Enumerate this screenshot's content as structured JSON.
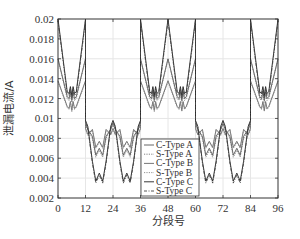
{
  "chart_data": {
    "type": "line",
    "title": "",
    "xlabel": "分段号",
    "ylabel": "泄漏电流/A",
    "xlim": [
      0,
      96
    ],
    "ylim": [
      0.002,
      0.02
    ],
    "xticks": [
      0,
      12,
      24,
      36,
      48,
      60,
      72,
      84,
      96
    ],
    "yticks": [
      0.002,
      0.004,
      0.006,
      0.008,
      0.01,
      0.012,
      0.014,
      0.016,
      0.018,
      0.02
    ],
    "ytick_labels": [
      "0.002",
      "0.004",
      "0.006",
      "0.008",
      "0.01",
      "0.012",
      "0.014",
      "0.016",
      "0.018",
      "0.02"
    ],
    "grid": true,
    "legend_position": "lower center",
    "series": [
      {
        "name": "C-Type A",
        "style": "solid",
        "color": "#555555",
        "high_peak": 0.016,
        "high_trough": 0.012,
        "low_edge": 0.0095,
        "low_dip": 0.0063,
        "low_bump": 0.007
      },
      {
        "name": "S-Type A",
        "style": "dotted",
        "color": "#777777",
        "high_peak": 0.016,
        "high_trough": 0.0118,
        "low_edge": 0.0094,
        "low_dip": 0.0061,
        "low_bump": 0.0068
      },
      {
        "name": "C-Type B",
        "style": "solid",
        "color": "#666666",
        "high_peak": 0.0138,
        "high_trough": 0.011,
        "low_edge": 0.009,
        "low_dip": 0.0071,
        "low_bump": 0.0077
      },
      {
        "name": "S-Type B",
        "style": "dotted",
        "color": "#888888",
        "high_peak": 0.0137,
        "high_trough": 0.0109,
        "low_edge": 0.0089,
        "low_dip": 0.007,
        "low_bump": 0.0076
      },
      {
        "name": "C-Type C",
        "style": "solid",
        "color": "#222222",
        "high_peak": 0.02,
        "high_trough": 0.0125,
        "low_edge": 0.0098,
        "low_dip": 0.0037,
        "low_bump": 0.0045
      },
      {
        "name": "S-Type C",
        "style": "dashdot",
        "color": "#444444",
        "high_peak": 0.0198,
        "high_trough": 0.0123,
        "low_edge": 0.0097,
        "low_dip": 0.0035,
        "low_bump": 0.0043
      }
    ],
    "pattern": {
      "high_segments": [
        [
          0,
          12
        ],
        [
          36,
          48
        ],
        [
          48,
          60
        ],
        [
          84,
          96
        ]
      ],
      "low_segments": [
        [
          12,
          24
        ],
        [
          24,
          36
        ],
        [
          60,
          72
        ],
        [
          72,
          84
        ]
      ]
    }
  },
  "labels": {
    "xlabel": "分段号",
    "ylabel": "泄漏电流/A"
  },
  "legend": [
    "C-Type A",
    "S-Type A",
    "C-Type B",
    "S-Type B",
    "C-Type C",
    "S-Type C"
  ]
}
